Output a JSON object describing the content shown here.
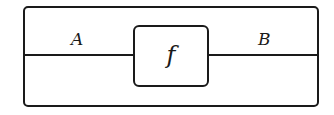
{
  "diagram": {
    "morphism": "f",
    "input_wire_label": "A",
    "output_wire_label": "B"
  }
}
